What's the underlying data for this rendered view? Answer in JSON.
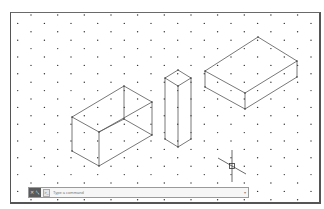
{
  "app": {
    "view": "isometric-drafting-canvas",
    "grid": {
      "style": "isometric-dots",
      "spacing_x": 13.33,
      "spacing_y": 8.4,
      "dot_color": "#333333"
    }
  },
  "drawing": {
    "line_color": "#555555",
    "objects": [
      {
        "name": "left-open-box",
        "vertices": [
          [
            124,
            86
          ],
          [
            152,
            102
          ],
          [
            72,
            117
          ],
          [
            99,
            132
          ],
          [
            72,
            151
          ],
          [
            99,
            166
          ],
          [
            152,
            135
          ],
          [
            124,
            119
          ]
        ],
        "edges": [
          [
            0,
            1
          ],
          [
            0,
            2
          ],
          [
            2,
            3
          ],
          [
            3,
            1
          ],
          [
            2,
            4
          ],
          [
            3,
            5
          ],
          [
            4,
            5
          ],
          [
            5,
            6
          ],
          [
            1,
            6
          ],
          [
            0,
            7
          ],
          [
            7,
            6
          ],
          [
            7,
            3
          ]
        ]
      },
      {
        "name": "tall-column",
        "vertices": [
          [
            178,
            70
          ],
          [
            191,
            78
          ],
          [
            178,
            86
          ],
          [
            165,
            78
          ],
          [
            165,
            139
          ],
          [
            178,
            147
          ],
          [
            191,
            139
          ]
        ],
        "edges": [
          [
            0,
            1
          ],
          [
            1,
            2
          ],
          [
            2,
            3
          ],
          [
            3,
            0
          ],
          [
            3,
            4
          ],
          [
            2,
            5
          ],
          [
            1,
            6
          ],
          [
            4,
            5
          ],
          [
            5,
            6
          ]
        ]
      },
      {
        "name": "right-slab",
        "vertices": [
          [
            258,
            37
          ],
          [
            297,
            61
          ],
          [
            245,
            93
          ],
          [
            205,
            71
          ],
          [
            205,
            87
          ],
          [
            245,
            109
          ],
          [
            297,
            77
          ]
        ],
        "edges": [
          [
            0,
            1
          ],
          [
            1,
            2
          ],
          [
            2,
            3
          ],
          [
            3,
            0
          ],
          [
            3,
            4
          ],
          [
            2,
            5
          ],
          [
            1,
            6
          ],
          [
            4,
            5
          ],
          [
            5,
            6
          ]
        ]
      }
    ],
    "cursor": {
      "x": 232,
      "y": 166,
      "type": "isometric-crosshair"
    }
  },
  "command_line": {
    "close_icon": "✕",
    "customize_icon": "🔧",
    "prompt_icon": ">_",
    "placeholder": "Type a command",
    "value": "",
    "dropdown_icon": "▾"
  }
}
